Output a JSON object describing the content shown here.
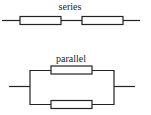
{
  "diagram": {
    "series": {
      "label": "series",
      "resistor_count": 2
    },
    "parallel": {
      "label": "parallel",
      "resistor_count": 2
    }
  },
  "colors": {
    "stroke": "#222222",
    "background": "#ffffff"
  }
}
